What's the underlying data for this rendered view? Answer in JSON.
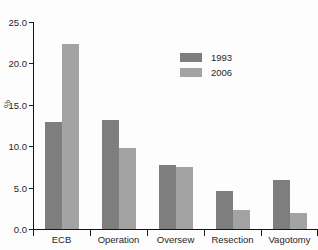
{
  "chart_data": {
    "type": "bar",
    "title": "",
    "xlabel": "",
    "ylabel": "%",
    "categories": [
      "ECB",
      "Operation",
      "Oversew",
      "Resection",
      "Vagotomy"
    ],
    "series": [
      {
        "name": "1993",
        "color": "#7e7e7e",
        "values": [
          12.9,
          13.2,
          7.7,
          4.6,
          5.9
        ]
      },
      {
        "name": "2006",
        "color": "#a3a3a3",
        "values": [
          22.3,
          9.8,
          7.5,
          2.3,
          1.9
        ]
      }
    ],
    "ylim": [
      0.0,
      25.0
    ],
    "ytick_labels": [
      "0.0",
      "5.0",
      "10.0",
      "15.0",
      "20.0",
      "25.0"
    ],
    "ytick_values": [
      0.0,
      5.0,
      10.0,
      15.0,
      20.0,
      25.0
    ],
    "grid": false,
    "legend_position": "upper-center"
  }
}
